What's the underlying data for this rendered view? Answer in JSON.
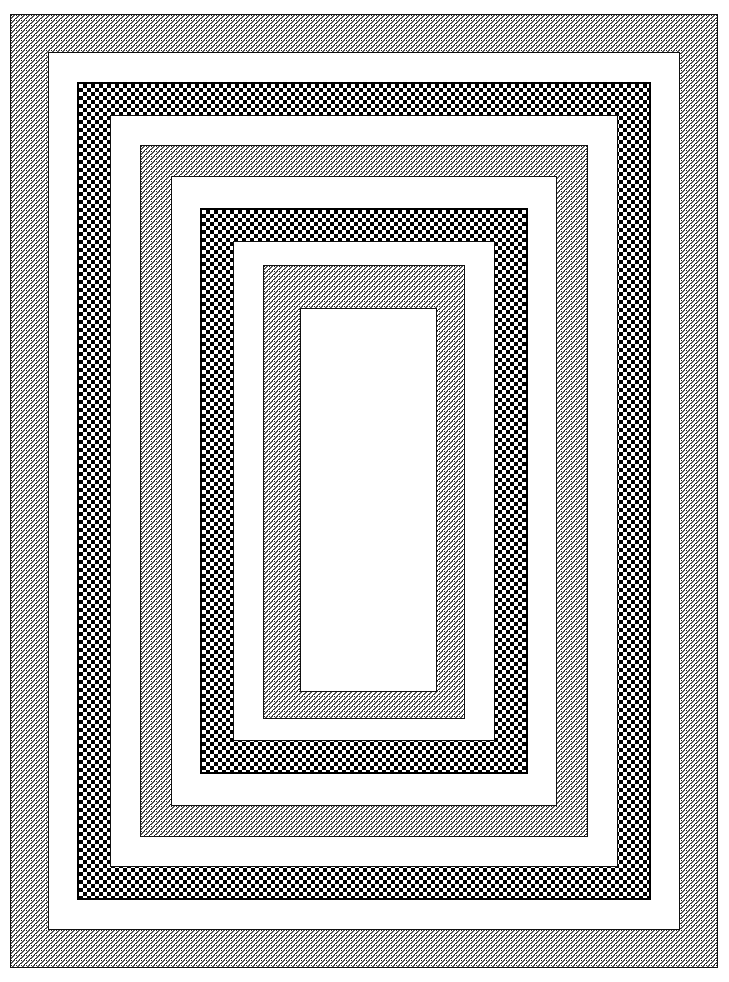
{
  "artwork": {
    "title": "Concentric Nested Rectangular Frames",
    "description": "A set of ten concentric rectangular bands alternating between a fine diagonal hatch texture and a high-contrast checkerboard texture, enclosing a plain white rectangle at the centre.",
    "canvas": {
      "width": 729,
      "height": 982,
      "background_color": "#ffffff"
    },
    "palette": {
      "ink": "#111111",
      "black": "#000000",
      "white": "#ffffff",
      "hatch_mid": "#555555"
    },
    "patterns": [
      {
        "id": "hatch",
        "name": "diagonal-hatch",
        "label": "Fine diagonal hatch",
        "cell_px": 5
      },
      {
        "id": "checker",
        "name": "checkerboard",
        "label": "Checkerboard",
        "cell_px": 4
      },
      {
        "id": "white",
        "name": "solid-white",
        "label": "Solid white",
        "cell_px": 0
      }
    ],
    "bands": [
      {
        "index": 1,
        "name": "band-outer-hatch",
        "pattern": "hatch",
        "outline": "thin",
        "x": 10,
        "y": 14,
        "width": 708,
        "height": 954,
        "thickness": 38
      },
      {
        "index": 2,
        "name": "band-gap-1",
        "pattern": "white",
        "outline": "thin",
        "x": 48,
        "y": 52,
        "width": 632,
        "height": 878,
        "thickness": 29
      },
      {
        "index": 3,
        "name": "band-checker-outer",
        "pattern": "checker",
        "outline": "thick",
        "x": 77,
        "y": 82,
        "width": 574,
        "height": 818,
        "thickness": 33
      },
      {
        "index": 4,
        "name": "band-gap-2",
        "pattern": "white",
        "outline": "thin",
        "x": 110,
        "y": 115,
        "width": 508,
        "height": 752,
        "thickness": 30
      },
      {
        "index": 5,
        "name": "band-hatch-middle",
        "pattern": "hatch",
        "outline": "thin",
        "x": 140,
        "y": 145,
        "width": 448,
        "height": 692,
        "thickness": 31
      },
      {
        "index": 6,
        "name": "band-gap-3",
        "pattern": "white",
        "outline": "thin",
        "x": 171,
        "y": 176,
        "width": 386,
        "height": 630,
        "thickness": 29
      },
      {
        "index": 7,
        "name": "band-checker-inner",
        "pattern": "checker",
        "outline": "thick",
        "x": 200,
        "y": 208,
        "width": 328,
        "height": 566,
        "thickness": 33
      },
      {
        "index": 8,
        "name": "band-gap-4",
        "pattern": "white",
        "outline": "thin",
        "x": 233,
        "y": 241,
        "width": 262,
        "height": 500,
        "thickness": 30
      },
      {
        "index": 9,
        "name": "band-hatch-inner",
        "pattern": "hatch",
        "outline": "thin",
        "x": 263,
        "y": 265,
        "width": 202,
        "height": 454,
        "thickness": 37
      },
      {
        "index": 10,
        "name": "center-white-panel",
        "pattern": "white",
        "outline": "thin",
        "x": 300,
        "y": 308,
        "width": 137,
        "height": 384,
        "thickness": 0
      }
    ],
    "counts": {
      "total_bands": 10,
      "hatch_bands": 3,
      "checker_bands": 2,
      "white_bands": 5
    }
  }
}
